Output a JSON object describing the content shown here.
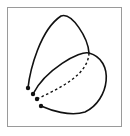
{
  "figure": {
    "title": "Two loops with dashed connecting arc",
    "frame_color": "#9a9a9a",
    "stroke_color": "#111111",
    "curves": {
      "upper_loop": "M28 88 C 30 70, 40 30, 61 16 C 72 12, 88 38, 89 53",
      "lower_loop": "M33 94 C 45 70, 80 50, 89 53 C 115 60, 110 100, 85 112 C 70 117, 50 110, 41 106",
      "dashed_arc": "M89 53 C 88 75, 60 88, 37 99"
    },
    "endpoints": [
      {
        "x": 28,
        "y": 88
      },
      {
        "x": 33,
        "y": 94
      },
      {
        "x": 37,
        "y": 99
      },
      {
        "x": 41,
        "y": 106
      }
    ]
  }
}
